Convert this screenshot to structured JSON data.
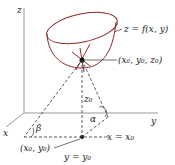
{
  "diagram": {
    "axes": {
      "z": "z",
      "y": "y",
      "x": "x"
    },
    "surface_label": "z = f(x, y)",
    "point_3d_label": "(x₀, y₀, z₀)",
    "point_2d_label": "(x₀, y₀)",
    "height_label": "z₀",
    "line_x_label": "x = x₀",
    "line_y_label": "y = y₀",
    "angle_alpha": "α",
    "angle_beta": "β",
    "colors": {
      "surface": "#8b2a2a",
      "axes": "#888888",
      "ink": "#222222"
    }
  }
}
